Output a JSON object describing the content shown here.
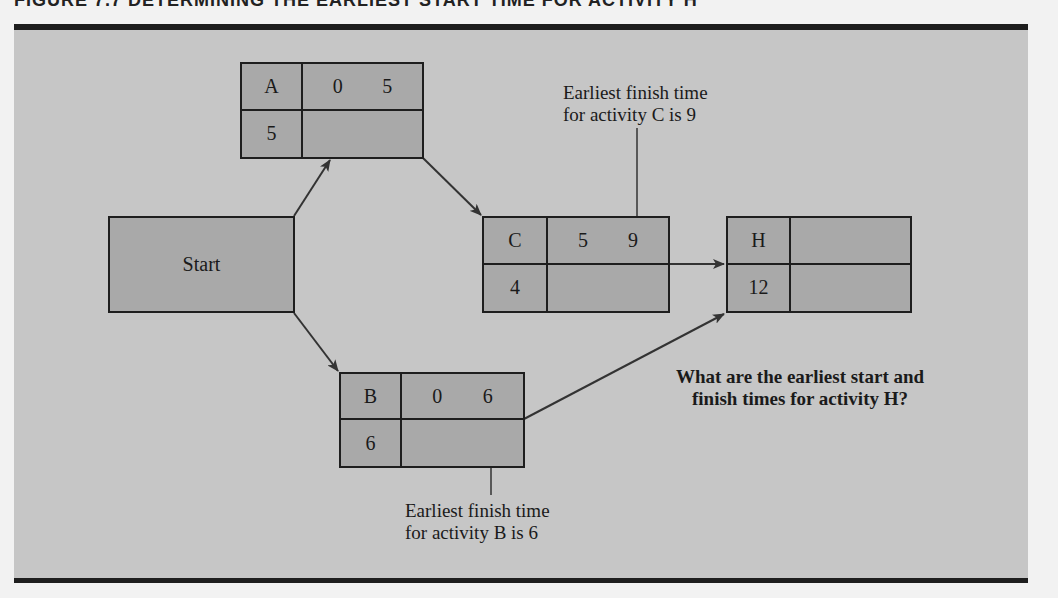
{
  "figure": {
    "title": "FIGURE 7.7   DETERMINING THE EARLIEST START TIME FOR ACTIVITY H"
  },
  "colors": {
    "panel_bg": "#c6c6c6",
    "node_fill": "#a9a9a9",
    "line": "#1e1e1e"
  },
  "start_node": {
    "label": "Start"
  },
  "nodes": {
    "A": {
      "name": "A",
      "earliest_start": "0",
      "earliest_finish": "5",
      "duration": "5"
    },
    "B": {
      "name": "B",
      "earliest_start": "0",
      "earliest_finish": "6",
      "duration": "6"
    },
    "C": {
      "name": "C",
      "earliest_start": "5",
      "earliest_finish": "9",
      "duration": "4"
    },
    "H": {
      "name": "H",
      "earliest_start": "",
      "earliest_finish": "",
      "duration": "12"
    }
  },
  "edges": [
    {
      "from": "Start",
      "to": "A"
    },
    {
      "from": "Start",
      "to": "B"
    },
    {
      "from": "A",
      "to": "C"
    },
    {
      "from": "C",
      "to": "H"
    },
    {
      "from": "B",
      "to": "H"
    }
  ],
  "annotations": {
    "c_note_line1": "Earliest finish time",
    "c_note_line2": "for activity C is 9",
    "b_note_line1": "Earliest finish time",
    "b_note_line2": "for activity B is 6",
    "question_line1": "What are the earliest start and",
    "question_line2": "finish times for activity H?"
  }
}
